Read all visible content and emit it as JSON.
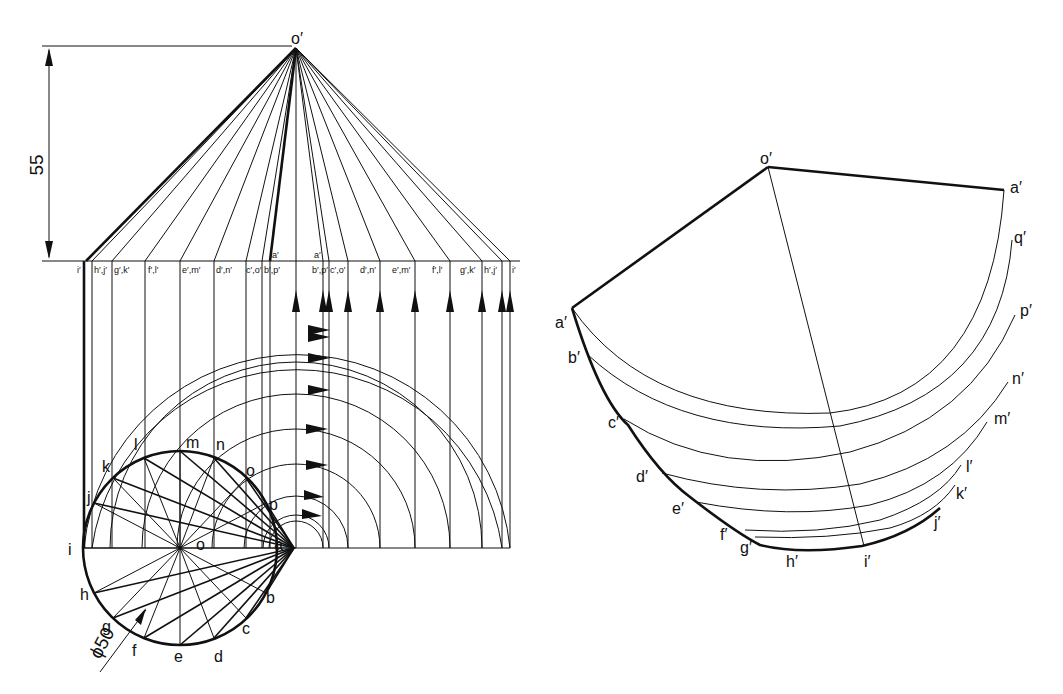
{
  "figure": {
    "type": "oblique-cone-development",
    "colors": {
      "line": "#111111",
      "background": "#ffffff"
    }
  },
  "front_view": {
    "apex_label": "o′",
    "dimension_height": "55",
    "base_labels_left": [
      "i′",
      "h′,j′",
      "g′,k′",
      "f′,l′",
      "e′,m′",
      "d′,n′",
      "c′,o′",
      "b′,p′"
    ],
    "a_label_left": "a′",
    "a_label_right": "a′",
    "base_labels_right": [
      "b′,p′",
      "c′,o′",
      "d′,n′",
      "e′,m′",
      "f′,l′",
      "g′,k′",
      "h′,j′",
      "i′"
    ]
  },
  "plan_view": {
    "diameter_label": "ϕ50",
    "center_label": "o",
    "points_upper": [
      "i",
      "j",
      "k",
      "l",
      "m",
      "n",
      "o",
      "p",
      "a"
    ],
    "points_lower": [
      "h",
      "g",
      "f",
      "e",
      "d",
      "c",
      "b"
    ]
  },
  "development": {
    "apex_label": "o′",
    "edge_start": "a′",
    "edge_end": "a′",
    "left_labels": [
      "b′",
      "c′",
      "d′",
      "e′",
      "f′",
      "g′",
      "h′"
    ],
    "bottom_label": "i′",
    "right_labels": [
      "q′",
      "p′",
      "n′",
      "m′",
      "l′",
      "k′",
      "j′"
    ]
  }
}
